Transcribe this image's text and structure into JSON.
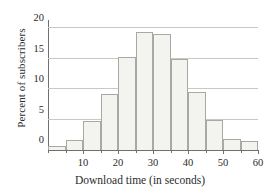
{
  "chart_data": {
    "type": "bar",
    "title": "",
    "xlabel": "Download time (in seconds)",
    "ylabel": "Percent of subscribers",
    "xlim": [
      0,
      60
    ],
    "ylim": [
      0,
      21
    ],
    "bin_width": 5,
    "grid": true,
    "legend": null,
    "categories": [
      "0-5",
      "5-10",
      "10-15",
      "15-20",
      "20-25",
      "25-30",
      "30-35",
      "35-40",
      "40-45",
      "45-50",
      "50-55",
      "55-60"
    ],
    "bin_edges": [
      0,
      5,
      10,
      15,
      20,
      25,
      30,
      35,
      40,
      45,
      50,
      55,
      60
    ],
    "values": [
      0.6,
      4.7,
      1.6,
      9.2,
      15.3,
      19.3,
      19.0,
      14.9,
      9.5,
      5.0,
      1.8,
      1.5
    ],
    "bars": [
      {
        "x0": 0,
        "x1": 5,
        "value": 0.6
      },
      {
        "x0": 5,
        "x1": 10,
        "value": 1.6
      },
      {
        "x0": 10,
        "x1": 15,
        "value": 4.7
      },
      {
        "x0": 15,
        "x1": 20,
        "value": 9.2
      },
      {
        "x0": 20,
        "x1": 25,
        "value": 15.3
      },
      {
        "x0": 25,
        "x1": 30,
        "value": 19.3
      },
      {
        "x0": 30,
        "x1": 35,
        "value": 19.0
      },
      {
        "x0": 35,
        "x1": 40,
        "value": 14.9
      },
      {
        "x0": 40,
        "x1": 45,
        "value": 9.5
      },
      {
        "x0": 45,
        "x1": 50,
        "value": 5.0
      },
      {
        "x0": 50,
        "x1": 55,
        "value": 1.8
      },
      {
        "x0": 55,
        "x1": 60,
        "value": 1.5
      }
    ],
    "yticks": [
      0,
      5,
      10,
      15,
      20
    ],
    "ytick_labels": [
      "0",
      "5",
      "10",
      "15",
      "20"
    ],
    "xticks": [
      10,
      20,
      30,
      40,
      50,
      60
    ],
    "xtick_labels": [
      "10",
      "20",
      "30",
      "40",
      "50",
      "60"
    ],
    "gridlines": [
      5,
      10,
      15,
      20
    ],
    "colors": {
      "bar_fill": "#f3f3f0",
      "bar_edge": "#a8a8a4",
      "grid": "#c9c9c4",
      "axis": "#6f6f6f",
      "text": "#2b2b2b",
      "background": "#ffffff"
    }
  }
}
